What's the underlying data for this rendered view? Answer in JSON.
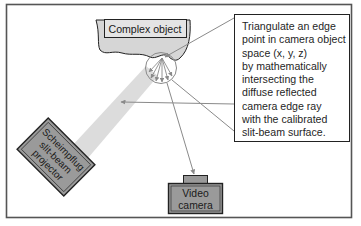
{
  "diagram": {
    "object_label": "Complex object",
    "projector_label": [
      "Scheimpflug",
      "slit-beam",
      "projector"
    ],
    "camera_label": [
      "Video",
      "camera"
    ],
    "note_lines": [
      "Triangulate an edge",
      "point in camera object",
      "space (x, y, z)",
      "by mathematically",
      "intersecting the",
      "diffuse reflected",
      "camera edge ray",
      "with the calibrated",
      "slit-beam surface."
    ],
    "colors": {
      "frame": "#555555",
      "object_fill": "#d6d6d6",
      "device_fill": "#9a9a9a",
      "beam": "#d9d9d9",
      "arrow": "#8a8a8a",
      "text": "#1f1f1f"
    }
  }
}
